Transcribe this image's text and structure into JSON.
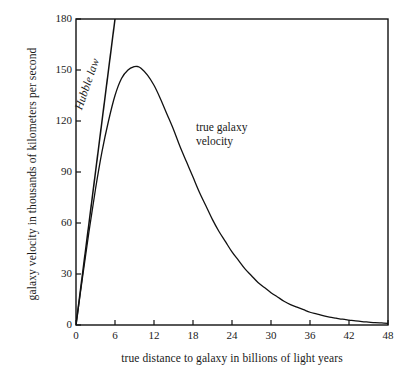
{
  "chart_data": {
    "type": "line",
    "title": "",
    "xlabel": "true distance to galaxy in billions of light years",
    "ylabel": "galaxy velocity in thousands of kilometers per second",
    "xlim": [
      0,
      48
    ],
    "ylim": [
      0,
      180
    ],
    "xticks": [
      0,
      6,
      12,
      18,
      24,
      30,
      36,
      42,
      48
    ],
    "yticks": [
      0,
      30,
      60,
      90,
      120,
      150,
      180
    ],
    "grid": false,
    "legend": "none",
    "annotations": [
      {
        "name": "hubble-law-label",
        "text": "Hubble law",
        "style": "italic",
        "rotated": true
      },
      {
        "name": "true-galaxy-velocity-label",
        "line1": "true galaxy",
        "line2": "velocity"
      }
    ],
    "series": [
      {
        "name": "Hubble law",
        "type": "line",
        "x": [
          0,
          48
        ],
        "values": [
          0,
          1440
        ],
        "note": "straight line through origin, slope 30 thousand km/s per billion ly; exits top of plot at x ≈ 6"
      },
      {
        "name": "true galaxy velocity",
        "type": "line",
        "x": [
          0,
          1,
          2,
          3,
          4,
          5,
          6,
          7,
          8,
          9,
          9.5,
          10,
          11,
          12,
          13,
          14,
          15,
          16,
          17,
          18,
          19,
          20,
          21,
          22,
          23,
          24,
          25,
          26,
          27,
          28,
          29,
          30,
          31,
          32,
          33,
          34,
          35,
          36,
          37,
          38,
          39,
          40,
          41,
          42,
          43,
          44,
          45,
          46,
          47,
          48
        ],
        "values": [
          0,
          28,
          55,
          80,
          102,
          120,
          135,
          145,
          150,
          152,
          152,
          151,
          147,
          141,
          133,
          124,
          115,
          105,
          96,
          87,
          78,
          70,
          62,
          55,
          49,
          43,
          38,
          33,
          29,
          25,
          22,
          19,
          16.5,
          14,
          12,
          10.5,
          9,
          7.5,
          6.5,
          5.5,
          4.6,
          4,
          3.4,
          2.9,
          2.4,
          2,
          1.7,
          1.4,
          1.2,
          1
        ]
      }
    ]
  }
}
